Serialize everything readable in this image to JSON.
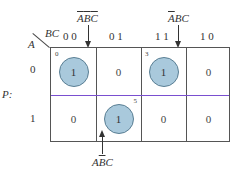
{
  "kmap": {
    "function_label": "P:",
    "row_var": "A",
    "col_var": "BC",
    "col_headers": [
      "0 0",
      "0 1",
      "1 1",
      "1 0"
    ],
    "row_headers": [
      "0",
      "1"
    ],
    "cells": [
      [
        {
          "value": "1",
          "circled": true,
          "index": "0"
        },
        {
          "value": "0",
          "circled": false
        },
        {
          "value": "1",
          "circled": true,
          "index": "3"
        },
        {
          "value": "0",
          "circled": false
        }
      ],
      [
        {
          "value": "0",
          "circled": false
        },
        {
          "value": "1",
          "circled": true,
          "index": "5"
        },
        {
          "value": "0",
          "circled": false
        },
        {
          "value": "0",
          "circled": false
        }
      ]
    ],
    "annotations": [
      {
        "term": "A̅B̅C̅",
        "points_to_cell": "0"
      },
      {
        "term": "A̅BC",
        "points_to_cell": "3"
      },
      {
        "term": "AB̅C",
        "points_to_cell": "5"
      }
    ],
    "colors": {
      "circle_fill": "#a9c9dc",
      "circle_border": "#5a7f94",
      "row_divider": "#7a4fd0",
      "grid": "#555555"
    }
  }
}
